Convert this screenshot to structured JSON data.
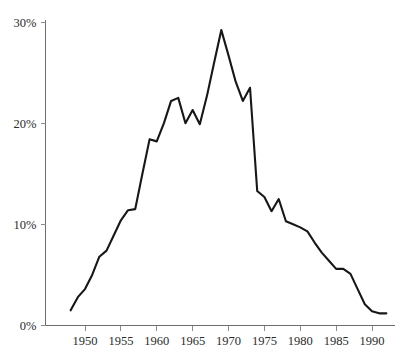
{
  "chart_data": {
    "type": "line",
    "title": "",
    "subtitle": "",
    "xlabel": "",
    "ylabel": "",
    "xlim": [
      1948,
      1992
    ],
    "ylim": [
      0,
      30
    ],
    "grid": false,
    "legend": null,
    "legend_position": "none",
    "y_tick_labels": [
      "0%",
      "10%",
      "20%",
      "30%"
    ],
    "y_ticks": [
      0,
      10,
      20,
      30
    ],
    "x_tick_labels": [
      "1950",
      "1955",
      "1960",
      "1965",
      "1970",
      "1975",
      "1980",
      "1985",
      "1990"
    ],
    "x_ticks": [
      1950,
      1955,
      1960,
      1965,
      1970,
      1975,
      1980,
      1985,
      1990
    ],
    "line_color": "#171717",
    "axis_color": "#6e6e6e",
    "series": [
      {
        "name": "value",
        "x": [
          1948,
          1949,
          1950,
          1951,
          1952,
          1953,
          1954,
          1955,
          1956,
          1957,
          1958,
          1959,
          1960,
          1961,
          1962,
          1963,
          1964,
          1965,
          1966,
          1967,
          1968,
          1969,
          1970,
          1971,
          1972,
          1973,
          1974,
          1975,
          1976,
          1977,
          1978,
          1979,
          1980,
          1981,
          1982,
          1983,
          1984,
          1985,
          1986,
          1987,
          1988,
          1989,
          1990,
          1991,
          1992
        ],
        "values": [
          1.5,
          2.8,
          3.6,
          5.0,
          6.8,
          7.4,
          8.9,
          10.4,
          11.4,
          11.5,
          15.0,
          18.4,
          18.2,
          20.0,
          22.2,
          22.5,
          20.0,
          21.3,
          19.9,
          22.7,
          26.0,
          29.2,
          26.7,
          24.1,
          22.2,
          23.5,
          13.3,
          12.7,
          11.3,
          12.5,
          10.3,
          10.0,
          9.7,
          9.3,
          8.2,
          7.2,
          6.4,
          5.6,
          5.6,
          5.1,
          3.6,
          2.1,
          1.4,
          1.2,
          1.2
        ]
      }
    ]
  }
}
